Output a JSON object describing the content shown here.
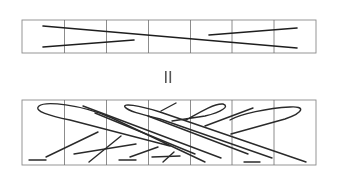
{
  "figure": {
    "symbol_between_panels": "II",
    "top_panel": {
      "cells": 7,
      "strokes": 3
    },
    "bottom_panel": {
      "cells": 7,
      "strokes": 20
    },
    "colors": {
      "background": "#ffffff",
      "frame": "#8a8a8a",
      "ink": "#2a2a2a"
    }
  }
}
